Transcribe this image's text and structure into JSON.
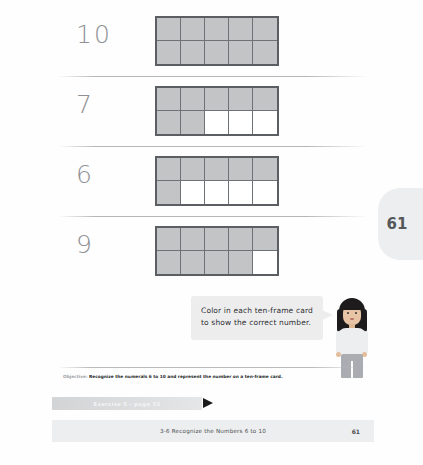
{
  "worksheet": {
    "side_tab_number": "61",
    "rows": [
      {
        "numeral": "10",
        "top_row_filled": 5,
        "bottom_row_filled": 5,
        "cells": [
          true,
          true,
          true,
          true,
          true,
          true,
          true,
          true,
          true,
          true
        ]
      },
      {
        "numeral": "7",
        "top_row_filled": 5,
        "bottom_row_filled": 2,
        "cells": [
          true,
          true,
          true,
          true,
          true,
          true,
          true,
          false,
          false,
          false
        ]
      },
      {
        "numeral": "6",
        "top_row_filled": 5,
        "bottom_row_filled": 1,
        "cells": [
          true,
          true,
          true,
          true,
          true,
          true,
          false,
          false,
          false,
          false
        ]
      },
      {
        "numeral": "9",
        "top_row_filled": 5,
        "bottom_row_filled": 4,
        "cells": [
          true,
          true,
          true,
          true,
          true,
          true,
          true,
          true,
          true,
          false
        ]
      }
    ],
    "callout": {
      "line1": "Color in each ten-frame card",
      "line2": "to show the correct number."
    },
    "objective": {
      "label": "Objective:",
      "text": "Recognize the numerals 6 to 10 and represent the number on a ten-frame card."
    },
    "exercise": {
      "label": "Exercise 5 - page 53"
    },
    "footer": {
      "text": "3-6  Recognize the Numbers 6 to 10",
      "page": "61"
    },
    "colors": {
      "filled_cell": "#c2c4c5",
      "frame_border": "#5b5f63",
      "numeral": "#8e9195",
      "callout_bg": "#ededee",
      "bar_bg": "#eceeef"
    }
  }
}
